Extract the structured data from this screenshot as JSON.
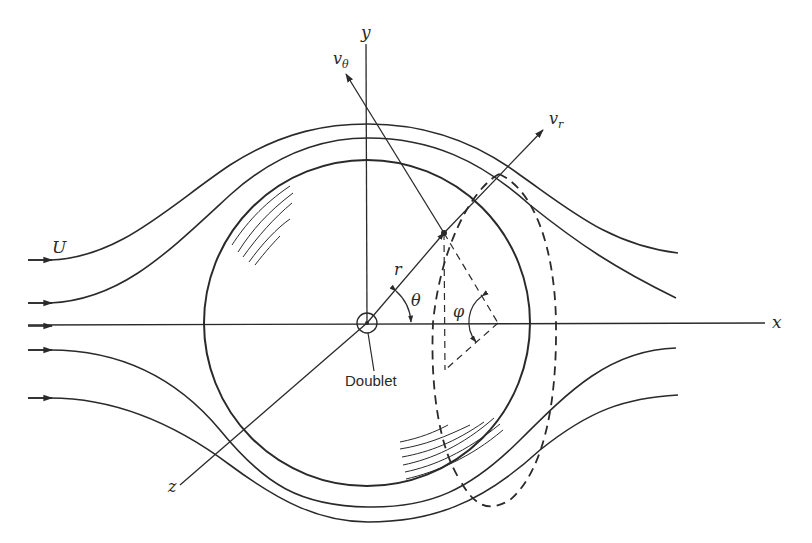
{
  "diagram": {
    "labels": {
      "x_axis": "x",
      "y_axis": "y",
      "z_axis": "z",
      "freestream": "U",
      "radial_velocity": "v",
      "radial_velocity_sub": "r",
      "tangential_velocity": "v",
      "tangential_velocity_sub": "θ",
      "radius": "r",
      "polar_angle": "θ",
      "azimuth_angle": "φ",
      "doublet": "Doublet"
    },
    "elements": {
      "sphere": "solid circle, center at origin",
      "streamlines_upper": 2,
      "streamlines_lower": 2,
      "centerline_streamline": 1,
      "dashed_circle": "circle of constant θ swept through angle φ about x-axis",
      "hatching": "shading arcs indicating sphere surface"
    },
    "colors": {
      "ink": "#2a2a2a",
      "background": "#ffffff"
    }
  }
}
